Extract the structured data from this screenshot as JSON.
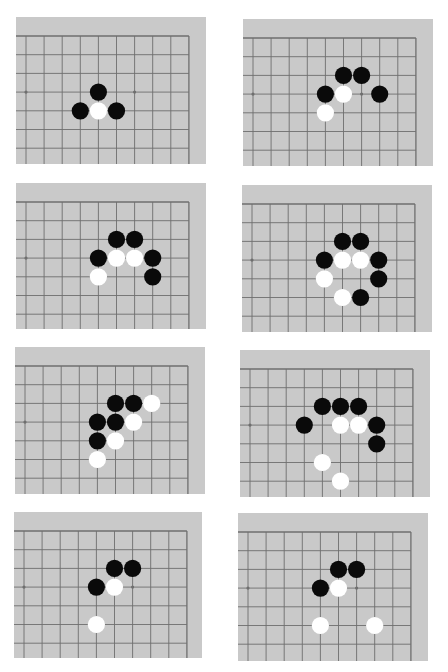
{
  "colors": {
    "page_bg": "#ffffff",
    "board_bg": "#c9c9c9",
    "grid_line": "#6e6e6e",
    "black_stone": "#0a0a0a",
    "white_stone": "#ffffff"
  },
  "grid": {
    "cols": 10,
    "rows": 7,
    "edge": "top-right corner region"
  },
  "star_points": [
    [
      0,
      3
    ],
    [
      6,
      3
    ]
  ],
  "diagrams": [
    {
      "id": 1,
      "stones": [
        {
          "c": 4,
          "r": 3,
          "color": "black"
        },
        {
          "c": 3,
          "r": 4,
          "color": "black"
        },
        {
          "c": 4,
          "r": 4,
          "color": "white"
        },
        {
          "c": 5,
          "r": 4,
          "color": "black"
        }
      ]
    },
    {
      "id": 2,
      "stones": [
        {
          "c": 5,
          "r": 2,
          "color": "black"
        },
        {
          "c": 6,
          "r": 2,
          "color": "black"
        },
        {
          "c": 4,
          "r": 3,
          "color": "black"
        },
        {
          "c": 5,
          "r": 3,
          "color": "white"
        },
        {
          "c": 7,
          "r": 3,
          "color": "black"
        },
        {
          "c": 4,
          "r": 4,
          "color": "white"
        }
      ]
    },
    {
      "id": 3,
      "stones": [
        {
          "c": 5,
          "r": 2,
          "color": "black"
        },
        {
          "c": 6,
          "r": 2,
          "color": "black"
        },
        {
          "c": 4,
          "r": 3,
          "color": "black"
        },
        {
          "c": 5,
          "r": 3,
          "color": "white"
        },
        {
          "c": 6,
          "r": 3,
          "color": "white"
        },
        {
          "c": 7,
          "r": 3,
          "color": "black"
        },
        {
          "c": 4,
          "r": 4,
          "color": "white"
        },
        {
          "c": 7,
          "r": 4,
          "color": "black"
        }
      ]
    },
    {
      "id": 4,
      "stones": [
        {
          "c": 5,
          "r": 2,
          "color": "black"
        },
        {
          "c": 6,
          "r": 2,
          "color": "black"
        },
        {
          "c": 4,
          "r": 3,
          "color": "black"
        },
        {
          "c": 5,
          "r": 3,
          "color": "white"
        },
        {
          "c": 6,
          "r": 3,
          "color": "white"
        },
        {
          "c": 7,
          "r": 3,
          "color": "black"
        },
        {
          "c": 4,
          "r": 4,
          "color": "white"
        },
        {
          "c": 7,
          "r": 4,
          "color": "black"
        },
        {
          "c": 5,
          "r": 5,
          "color": "white"
        },
        {
          "c": 6,
          "r": 5,
          "color": "black"
        }
      ]
    },
    {
      "id": 5,
      "stones": [
        {
          "c": 5,
          "r": 2,
          "color": "black"
        },
        {
          "c": 6,
          "r": 2,
          "color": "black"
        },
        {
          "c": 7,
          "r": 2,
          "color": "white"
        },
        {
          "c": 4,
          "r": 3,
          "color": "black"
        },
        {
          "c": 5,
          "r": 3,
          "color": "black"
        },
        {
          "c": 6,
          "r": 3,
          "color": "white"
        },
        {
          "c": 4,
          "r": 4,
          "color": "black"
        },
        {
          "c": 5,
          "r": 4,
          "color": "white"
        },
        {
          "c": 4,
          "r": 5,
          "color": "white"
        }
      ]
    },
    {
      "id": 6,
      "stones": [
        {
          "c": 4,
          "r": 2,
          "color": "black"
        },
        {
          "c": 5,
          "r": 2,
          "color": "black"
        },
        {
          "c": 6,
          "r": 2,
          "color": "black"
        },
        {
          "c": 3,
          "r": 3,
          "color": "black"
        },
        {
          "c": 5,
          "r": 3,
          "color": "white"
        },
        {
          "c": 6,
          "r": 3,
          "color": "white"
        },
        {
          "c": 7,
          "r": 3,
          "color": "black"
        },
        {
          "c": 7,
          "r": 4,
          "color": "black"
        },
        {
          "c": 4,
          "r": 5,
          "color": "white"
        },
        {
          "c": 5,
          "r": 6,
          "color": "white"
        }
      ]
    },
    {
      "id": 7,
      "stones": [
        {
          "c": 5,
          "r": 2,
          "color": "black"
        },
        {
          "c": 6,
          "r": 2,
          "color": "black"
        },
        {
          "c": 4,
          "r": 3,
          "color": "black"
        },
        {
          "c": 5,
          "r": 3,
          "color": "white"
        },
        {
          "c": 4,
          "r": 5,
          "color": "white"
        }
      ]
    },
    {
      "id": 8,
      "stones": [
        {
          "c": 5,
          "r": 2,
          "color": "black"
        },
        {
          "c": 6,
          "r": 2,
          "color": "black"
        },
        {
          "c": 4,
          "r": 3,
          "color": "black"
        },
        {
          "c": 5,
          "r": 3,
          "color": "white"
        },
        {
          "c": 4,
          "r": 5,
          "color": "white"
        },
        {
          "c": 7,
          "r": 5,
          "color": "white"
        }
      ]
    }
  ]
}
